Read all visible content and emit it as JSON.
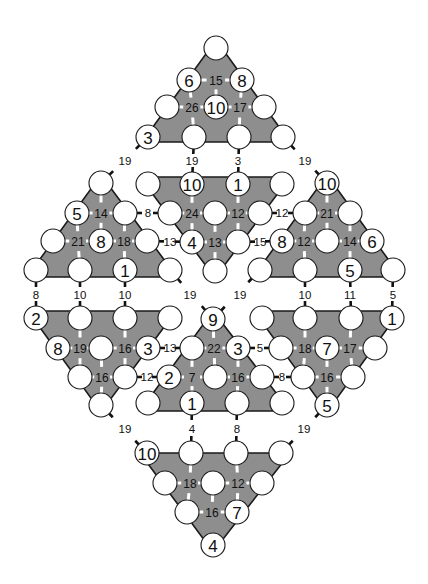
{
  "puzzle": {
    "colors": {
      "triangle_fill": "#8e8e8e",
      "circle_fill": "#ffffff",
      "line": "#1a1a1a"
    },
    "triangles": [
      {
        "name": "top",
        "points": "216,40 290,142 142,142",
        "circles": [
          [
            216,
            48,
            ""
          ],
          [
            189,
            80,
            "6"
          ],
          [
            242,
            80,
            "8"
          ],
          [
            167,
            107,
            ""
          ],
          [
            216,
            107,
            "10"
          ],
          [
            264,
            107,
            ""
          ],
          [
            148,
            137,
            "3"
          ],
          [
            194,
            137,
            ""
          ],
          [
            239,
            137,
            ""
          ],
          [
            283,
            137,
            ""
          ]
        ],
        "sums": [
          [
            216,
            80,
            "15"
          ],
          [
            192,
            107,
            "26"
          ],
          [
            240,
            107,
            "17"
          ]
        ]
      },
      {
        "name": "upper-left",
        "points": "101,175 177,277 27,277",
        "circles": [
          [
            101,
            183,
            ""
          ],
          [
            77,
            213,
            "5"
          ],
          [
            125,
            213,
            ""
          ],
          [
            53,
            241,
            ""
          ],
          [
            101,
            241,
            "8"
          ],
          [
            147,
            241,
            ""
          ],
          [
            36,
            270,
            ""
          ],
          [
            80,
            270,
            ""
          ],
          [
            125,
            270,
            "1"
          ],
          [
            170,
            270,
            ""
          ]
        ],
        "sums": [
          [
            101,
            213,
            "14"
          ],
          [
            78,
            241,
            "21"
          ],
          [
            124,
            241,
            "18"
          ]
        ]
      },
      {
        "name": "upper-center",
        "points": "140,177 290,177 215,278",
        "circles": [
          [
            148,
            184,
            ""
          ],
          [
            192,
            184,
            "10"
          ],
          [
            238,
            184,
            "1"
          ],
          [
            282,
            184,
            ""
          ],
          [
            170,
            213,
            ""
          ],
          [
            215,
            213,
            ""
          ],
          [
            260,
            213,
            ""
          ],
          [
            192,
            242,
            "4"
          ],
          [
            238,
            242,
            ""
          ],
          [
            215,
            271,
            ""
          ]
        ],
        "sums": [
          [
            192,
            213,
            "24"
          ],
          [
            238,
            213,
            "12"
          ],
          [
            215,
            242,
            "13"
          ]
        ]
      },
      {
        "name": "upper-right",
        "points": "327,175 401,277 253,277",
        "circles": [
          [
            327,
            183,
            "10"
          ],
          [
            305,
            213,
            ""
          ],
          [
            350,
            213,
            ""
          ],
          [
            282,
            241,
            "8"
          ],
          [
            327,
            241,
            ""
          ],
          [
            372,
            241,
            "6"
          ],
          [
            260,
            270,
            ""
          ],
          [
            305,
            270,
            ""
          ],
          [
            350,
            270,
            "5"
          ],
          [
            393,
            270,
            ""
          ]
        ],
        "sums": [
          [
            327,
            213,
            "21"
          ],
          [
            304,
            241,
            "12"
          ],
          [
            350,
            241,
            "14"
          ]
        ]
      },
      {
        "name": "lower-left",
        "points": "28,311 176,311 101,412",
        "circles": [
          [
            36,
            318,
            "2"
          ],
          [
            80,
            318,
            ""
          ],
          [
            125,
            318,
            ""
          ],
          [
            170,
            318,
            ""
          ],
          [
            58,
            348,
            "8"
          ],
          [
            101,
            348,
            ""
          ],
          [
            148,
            348,
            "3"
          ],
          [
            80,
            377,
            ""
          ],
          [
            125,
            377,
            ""
          ],
          [
            101,
            405,
            ""
          ]
        ],
        "sums": [
          [
            80,
            348,
            "19"
          ],
          [
            125,
            348,
            "16"
          ],
          [
            102,
            377,
            "16"
          ]
        ]
      },
      {
        "name": "lower-center",
        "points": "213,311 290,411 140,411",
        "circles": [
          [
            213,
            319,
            "9"
          ],
          [
            192,
            348,
            ""
          ],
          [
            238,
            348,
            "3"
          ],
          [
            169,
            377,
            "2"
          ],
          [
            215,
            377,
            ""
          ],
          [
            262,
            377,
            ""
          ],
          [
            148,
            403,
            ""
          ],
          [
            192,
            403,
            "1"
          ],
          [
            237,
            403,
            ""
          ],
          [
            282,
            403,
            ""
          ]
        ],
        "sums": [
          [
            214,
            348,
            "22"
          ],
          [
            192,
            377,
            "7"
          ],
          [
            238,
            377,
            "16"
          ]
        ]
      },
      {
        "name": "lower-right",
        "points": "254,311 400,311 327,412",
        "circles": [
          [
            262,
            318,
            ""
          ],
          [
            305,
            318,
            ""
          ],
          [
            351,
            318,
            ""
          ],
          [
            392,
            318,
            "1"
          ],
          [
            281,
            348,
            ""
          ],
          [
            327,
            348,
            "7"
          ],
          [
            375,
            348,
            ""
          ],
          [
            303,
            377,
            ""
          ],
          [
            353,
            377,
            ""
          ],
          [
            327,
            405,
            "5"
          ]
        ],
        "sums": [
          [
            305,
            348,
            "18"
          ],
          [
            350,
            348,
            "17"
          ],
          [
            327,
            377,
            "16"
          ]
        ]
      },
      {
        "name": "bottom",
        "points": "140,453 290,453 213,552",
        "circles": [
          [
            147,
            453,
            "10"
          ],
          [
            191,
            453,
            ""
          ],
          [
            236,
            453,
            ""
          ],
          [
            281,
            453,
            ""
          ],
          [
            165,
            483,
            ""
          ],
          [
            213,
            483,
            ""
          ],
          [
            262,
            483,
            ""
          ],
          [
            187,
            512,
            ""
          ],
          [
            237,
            512,
            "7"
          ],
          [
            213,
            545,
            "4"
          ]
        ],
        "sums": [
          [
            190,
            483,
            "18"
          ],
          [
            238,
            483,
            "12"
          ],
          [
            212,
            512,
            "16"
          ]
        ]
      }
    ],
    "links": [
      [
        148,
        137,
        101,
        183
      ],
      [
        194,
        137,
        192,
        184
      ],
      [
        239,
        137,
        238,
        184
      ],
      [
        283,
        137,
        327,
        183
      ],
      [
        125,
        213,
        170,
        213
      ],
      [
        260,
        213,
        305,
        213
      ],
      [
        147,
        241,
        192,
        242
      ],
      [
        238,
        242,
        282,
        241
      ],
      [
        36,
        270,
        36,
        318
      ],
      [
        80,
        270,
        80,
        318
      ],
      [
        125,
        270,
        125,
        318
      ],
      [
        170,
        270,
        213,
        319
      ],
      [
        260,
        270,
        213,
        319
      ],
      [
        305,
        270,
        305,
        318
      ],
      [
        350,
        270,
        351,
        318
      ],
      [
        393,
        270,
        392,
        318
      ],
      [
        148,
        348,
        192,
        348
      ],
      [
        238,
        348,
        281,
        348
      ],
      [
        125,
        377,
        169,
        377
      ],
      [
        262,
        377,
        303,
        377
      ],
      [
        101,
        405,
        147,
        453
      ],
      [
        192,
        403,
        191,
        453
      ],
      [
        237,
        403,
        236,
        453
      ],
      [
        327,
        405,
        281,
        453
      ]
    ],
    "clues": [
      [
        125,
        161,
        "19"
      ],
      [
        192,
        161,
        "19"
      ],
      [
        238,
        161,
        "3"
      ],
      [
        305,
        161,
        "19"
      ],
      [
        148,
        213,
        "8"
      ],
      [
        282,
        213,
        "12"
      ],
      [
        170,
        242,
        "13"
      ],
      [
        260,
        242,
        "15"
      ],
      [
        36,
        295,
        "8"
      ],
      [
        80,
        295,
        "10"
      ],
      [
        125,
        295,
        "10"
      ],
      [
        190,
        295,
        "19"
      ],
      [
        240,
        295,
        "19"
      ],
      [
        305,
        295,
        "10"
      ],
      [
        350,
        295,
        "11"
      ],
      [
        393,
        295,
        "5"
      ],
      [
        170,
        348,
        "13"
      ],
      [
        260,
        348,
        "5"
      ],
      [
        147,
        377,
        "12"
      ],
      [
        282,
        377,
        "8"
      ],
      [
        125,
        429,
        "19"
      ],
      [
        192,
        429,
        "4"
      ],
      [
        237,
        429,
        "8"
      ],
      [
        304,
        429,
        "19"
      ]
    ]
  }
}
